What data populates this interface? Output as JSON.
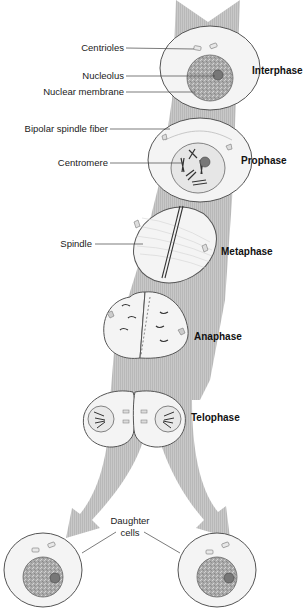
{
  "diagram": {
    "colors": {
      "band": "#c4c4c4",
      "cell_fill": "#f4f4f4",
      "cell_stroke": "#555555",
      "nucleus_fill": "#a8a8a8",
      "text": "#222222"
    },
    "phases": [
      {
        "label": "Interphase"
      },
      {
        "label": "Prophase"
      },
      {
        "label": "Metaphase"
      },
      {
        "label": "Anaphase"
      },
      {
        "label": "Telophase"
      }
    ],
    "labels": {
      "centrioles": "Centrioles",
      "nucleolus": "Nucleolus",
      "nuclear_membrane": "Nuclear membrane",
      "bipolar_spindle_fiber": "Bipolar spindle fiber",
      "centromere": "Centromere",
      "spindle": "Spindle",
      "daughter_cells_line1": "Daughter",
      "daughter_cells_line2": "cells"
    }
  }
}
